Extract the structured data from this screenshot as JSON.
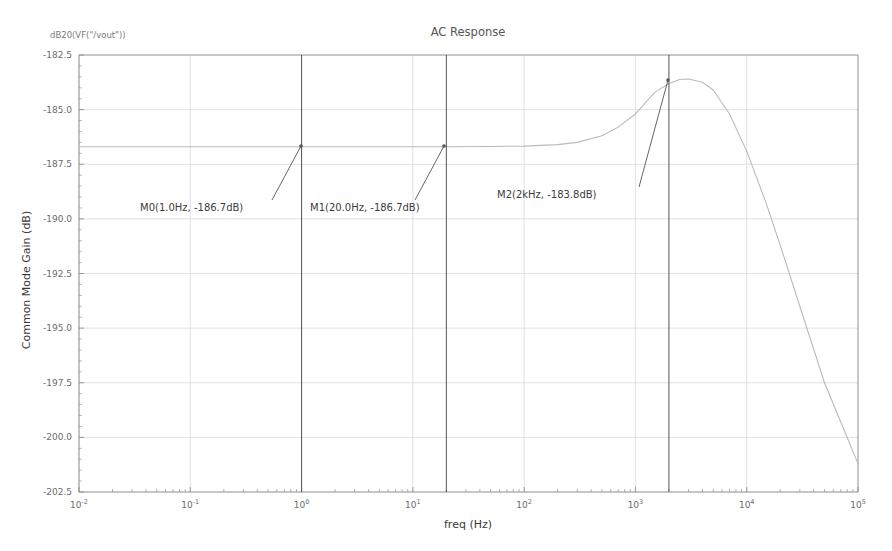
{
  "corner_label": "dB20(VF(\"/vout\"))",
  "chart_data": {
    "type": "line",
    "title": "AC Response",
    "xlabel": "freq (Hz)",
    "ylabel": "Common Mode Gain (dB)",
    "xscale": "log",
    "xlim": [
      0.01,
      100000
    ],
    "ylim": [
      -202.5,
      -182.5
    ],
    "grid": true,
    "legend": false,
    "x_ticks": [
      0.01,
      0.1,
      1,
      10,
      100,
      1000,
      10000,
      100000
    ],
    "x_tick_labels": [
      "10⁻²",
      "10⁻¹",
      "10⁰",
      "10¹",
      "10²",
      "10³",
      "10⁴",
      "10⁵"
    ],
    "x_tick_mantissa": [
      "10",
      "10",
      "10",
      "10",
      "10",
      "10",
      "10",
      "10"
    ],
    "x_tick_exponent": [
      "-2",
      "-1",
      "0",
      "1",
      "2",
      "3",
      "4",
      "5"
    ],
    "y_ticks": [
      -182.5,
      -185.0,
      -187.5,
      -190.0,
      -192.5,
      -195.0,
      -197.5,
      -200.0,
      -202.5
    ],
    "y_tick_labels": [
      "-182.5",
      "-185.0",
      "-187.5",
      "-190.0",
      "-192.5",
      "-195.0",
      "-197.5",
      "-200.0",
      "-202.5"
    ],
    "series": [
      {
        "name": "dB20(VF(\"/vout\"))",
        "color": "#b9b9c4",
        "x": [
          0.01,
          0.02,
          0.05,
          0.1,
          0.2,
          0.5,
          1.0,
          2.0,
          5.0,
          10.0,
          20.0,
          50.0,
          100.0,
          200.0,
          300.0,
          500.0,
          700.0,
          1000.0,
          1500.0,
          2000.0,
          2500.0,
          3000.0,
          4000.0,
          5000.0,
          7000.0,
          10000.0,
          15000.0,
          20000.0,
          30000.0,
          50000.0,
          70000.0,
          100000.0
        ],
        "y": [
          -186.7,
          -186.7,
          -186.7,
          -186.7,
          -186.7,
          -186.7,
          -186.7,
          -186.7,
          -186.7,
          -186.7,
          -186.7,
          -186.69,
          -186.67,
          -186.6,
          -186.5,
          -186.2,
          -185.8,
          -185.2,
          -184.2,
          -183.8,
          -183.62,
          -183.6,
          -183.75,
          -184.1,
          -185.2,
          -186.9,
          -189.3,
          -191.2,
          -194.0,
          -197.5,
          -199.3,
          -201.2
        ]
      }
    ],
    "markers": [
      {
        "id": "M0",
        "label": "M0(1.0Hz, -186.7dB)",
        "freq": 1.0,
        "freq_text": "1.0Hz",
        "gain": -186.7,
        "gain_text": "-186.7dB",
        "label_x": 140,
        "label_y": 211,
        "point_px": [
          301,
          146
        ],
        "leader_from": [
          272,
          200
        ]
      },
      {
        "id": "M1",
        "label": "M1(20.0Hz, -186.7dB)",
        "freq": 20.0,
        "freq_text": "20.0Hz",
        "gain": -186.7,
        "gain_text": "-186.7dB",
        "label_x": 310,
        "label_y": 211,
        "point_px": [
          444,
          146
        ],
        "leader_from": [
          415,
          200
        ]
      },
      {
        "id": "M2",
        "label": "M2(2kHz, -183.8dB)",
        "freq": 2000.0,
        "freq_text": "2kHz",
        "gain": -183.8,
        "gain_text": "-183.8dB",
        "label_x": 497,
        "label_y": 198,
        "point_px": [
          668,
          80
        ],
        "leader_from": [
          639,
          187
        ]
      }
    ],
    "marker_line_color": "#555555",
    "grid_color": "#d8d8e0",
    "axis_color": "#909090"
  }
}
